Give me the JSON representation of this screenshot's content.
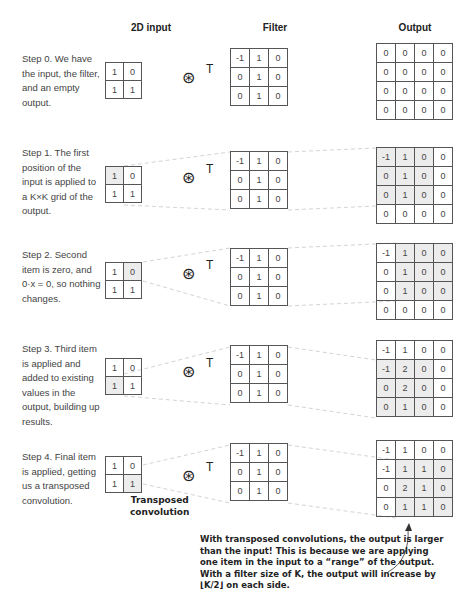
{
  "headers": {
    "input": "2D input",
    "filter": "Filter",
    "output": "Output"
  },
  "operator": {
    "symbol": "⊛",
    "superscript": "T",
    "label_line1": "Transposed",
    "label_line2": "convolution"
  },
  "steps": [
    {
      "text": "Step 0. We have the input, the filter, and an empty output.",
      "input": [
        [
          "1",
          "0"
        ],
        [
          "1",
          "1"
        ]
      ],
      "filter": [
        [
          "-1",
          "1",
          "0"
        ],
        [
          "0",
          "1",
          "0"
        ],
        [
          "0",
          "1",
          "0"
        ]
      ],
      "output": [
        [
          "0",
          "0",
          "0",
          "0"
        ],
        [
          "0",
          "0",
          "0",
          "0"
        ],
        [
          "0",
          "0",
          "0",
          "0"
        ],
        [
          "0",
          "0",
          "0",
          "0"
        ]
      ]
    },
    {
      "text": "Step 1. The first position of the input is applied to a K×K grid of the output.",
      "input": [
        [
          "1",
          "0"
        ],
        [
          "1",
          "1"
        ]
      ],
      "filter": [
        [
          "-1",
          "1",
          "0"
        ],
        [
          "0",
          "1",
          "0"
        ],
        [
          "0",
          "1",
          "0"
        ]
      ],
      "output": [
        [
          "-1",
          "1",
          "0",
          "0"
        ],
        [
          "0",
          "1",
          "0",
          "0"
        ],
        [
          "0",
          "1",
          "0",
          "0"
        ],
        [
          "0",
          "0",
          "0",
          "0"
        ]
      ]
    },
    {
      "text": "Step 2. Second item is zero, and 0·x = 0, so nothing changes.",
      "input": [
        [
          "1",
          "0"
        ],
        [
          "1",
          "1"
        ]
      ],
      "filter": [
        [
          "-1",
          "1",
          "0"
        ],
        [
          "0",
          "1",
          "0"
        ],
        [
          "0",
          "1",
          "0"
        ]
      ],
      "output": [
        [
          "-1",
          "1",
          "0",
          "0"
        ],
        [
          "0",
          "1",
          "0",
          "0"
        ],
        [
          "0",
          "1",
          "0",
          "0"
        ],
        [
          "0",
          "0",
          "0",
          "0"
        ]
      ]
    },
    {
      "text": "Step 3. Third item is applied and added to existing values in the output, building up results.",
      "input": [
        [
          "1",
          "0"
        ],
        [
          "1",
          "1"
        ]
      ],
      "filter": [
        [
          "-1",
          "1",
          "0"
        ],
        [
          "0",
          "1",
          "0"
        ],
        [
          "0",
          "1",
          "0"
        ]
      ],
      "output": [
        [
          "-1",
          "1",
          "0",
          "0"
        ],
        [
          "-1",
          "2",
          "0",
          "0"
        ],
        [
          "0",
          "2",
          "0",
          "0"
        ],
        [
          "0",
          "1",
          "0",
          "0"
        ]
      ]
    },
    {
      "text": "Step 4. Final item is applied, getting us a transposed convolution.",
      "input": [
        [
          "1",
          "0"
        ],
        [
          "1",
          "1"
        ]
      ],
      "filter": [
        [
          "-1",
          "1",
          "0"
        ],
        [
          "0",
          "1",
          "0"
        ],
        [
          "0",
          "1",
          "0"
        ]
      ],
      "output": [
        [
          "-1",
          "1",
          "0",
          "0"
        ],
        [
          "-1",
          "1",
          "1",
          "0"
        ],
        [
          "0",
          "2",
          "1",
          "0"
        ],
        [
          "0",
          "1",
          "1",
          "0"
        ]
      ]
    }
  ],
  "caption": {
    "line1": "With transposed convolutions, the output is larger",
    "line2": "than the input! This is because we are applying",
    "line3": "one item in the input to a “range” of the output.",
    "line4": "With a filter size of K, the output will increase by",
    "line5": "⌊K/2⌋ on each side."
  }
}
